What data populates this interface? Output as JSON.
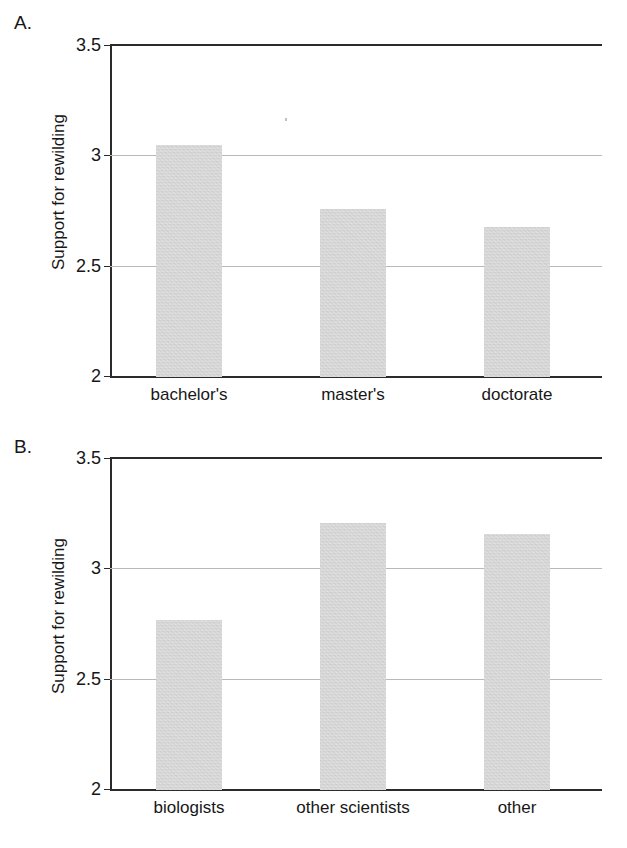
{
  "figure": {
    "background": "#ffffff",
    "bar_color": "#c8c8c8",
    "axis_color": "#2b2b2b",
    "gridline_color": "#b9b9b9"
  },
  "panels": [
    {
      "letter": "A.",
      "ylabel": "Support for rewilding",
      "yticks": [
        "3.5",
        "3",
        "2.5",
        "2"
      ],
      "categories": [
        "bachelor's",
        "master's",
        "doctorate"
      ],
      "values": [
        3.05,
        2.76,
        2.68
      ]
    },
    {
      "letter": "B.",
      "ylabel": "Support for rewilding",
      "yticks": [
        "3.5",
        "3",
        "2.5",
        "2"
      ],
      "categories": [
        "biologists",
        "other scientists",
        "other"
      ],
      "values": [
        2.77,
        3.21,
        3.16
      ]
    }
  ],
  "chart_data": [
    {
      "type": "bar",
      "title": "A.",
      "categories": [
        "bachelor's",
        "master's",
        "doctorate"
      ],
      "values": [
        3.05,
        2.76,
        2.68
      ],
      "xlabel": "",
      "ylabel": "Support for rewilding",
      "ylim": [
        2,
        3.5
      ],
      "yticks": [
        2,
        2.5,
        3,
        3.5
      ],
      "gridlines": [
        2.5,
        3.0
      ],
      "grid": true,
      "legend": false,
      "bar_color": "#c8c8c8"
    },
    {
      "type": "bar",
      "title": "B.",
      "categories": [
        "biologists",
        "other scientists",
        "other"
      ],
      "values": [
        2.77,
        3.21,
        3.16
      ],
      "xlabel": "",
      "ylabel": "Support for rewilding",
      "ylim": [
        2,
        3.5
      ],
      "yticks": [
        2,
        2.5,
        3,
        3.5
      ],
      "gridlines": [
        2.5,
        3.0
      ],
      "grid": true,
      "legend": false,
      "bar_color": "#c8c8c8"
    }
  ]
}
